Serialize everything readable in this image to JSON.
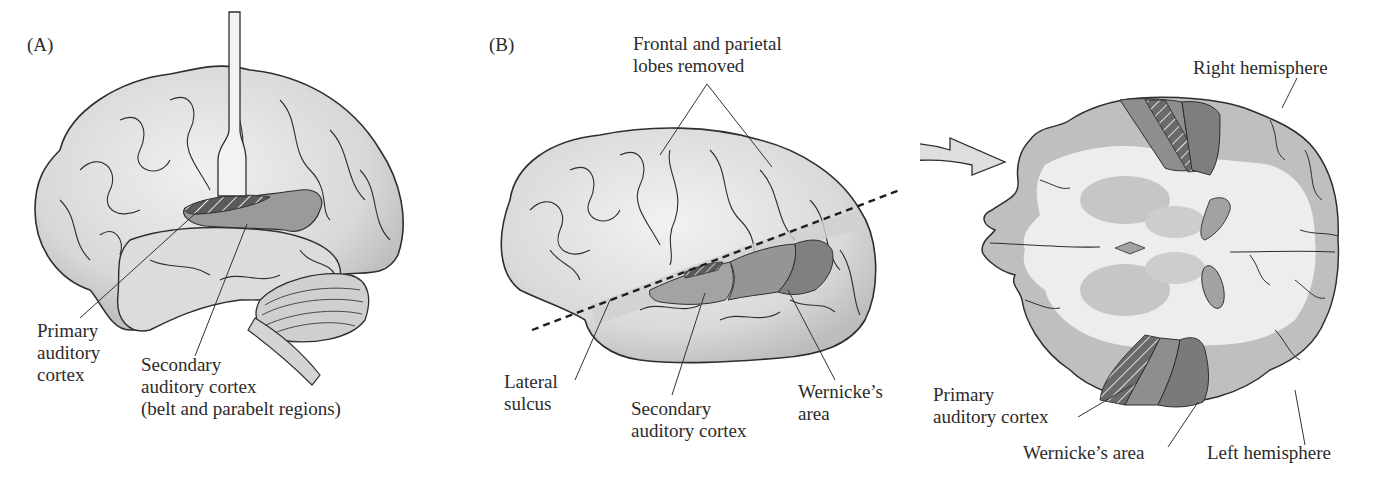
{
  "figure": {
    "panels": [
      {
        "id": "A",
        "letter": "(A)",
        "labels": {
          "primary_auditory_cortex": "Primary\nauditory\ncortex",
          "secondary_auditory_cortex": "Secondary\nauditory cortex\n(belt and parabelt regions)"
        }
      },
      {
        "id": "B",
        "letter": "(B)",
        "labels": {
          "frontal_parietal_removed": "Frontal and parietal\nlobes removed",
          "lateral_sulcus": "Lateral\nsulcus",
          "secondary_auditory_cortex": "Secondary\nauditory cortex",
          "wernickes_area": "Wernicke’s\narea"
        }
      },
      {
        "id": "B-section",
        "labels": {
          "right_hemisphere": "Right hemisphere",
          "primary_auditory_cortex": "Primary\nauditory cortex",
          "wernickes_area": "Wernicke’s area",
          "left_hemisphere": "Left hemisphere"
        }
      }
    ],
    "colors": {
      "cortex_surface": "#e4e4e4",
      "cortex_outline": "#2e2e2e",
      "secondary_region": "#9a9a9a",
      "wernicke_region": "#858585",
      "primary_hatch": "#5a5a5a",
      "white_matter": "#efefef",
      "gray_matter": "#bdbdbd",
      "deep_nuclei": "#c8c8c8",
      "ventricle": "#a0a0a0"
    }
  }
}
